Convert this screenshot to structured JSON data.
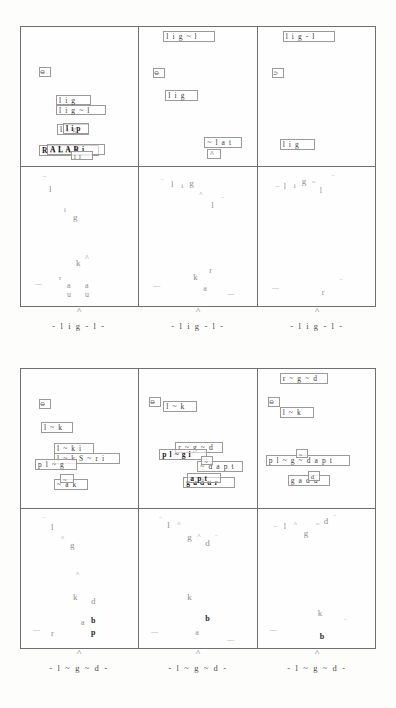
{
  "document": {
    "kind": "scanned-figure-page",
    "background_color": "#fdfdfc",
    "ink_color": "#2b2b2b",
    "box_color": "#9a9a9a",
    "frame_color": "#6f6f6f",
    "faint_color": "#8e8e8e"
  },
  "figures": [
    {
      "id": "figure-top",
      "caption_text": "- l i g - l -",
      "caption_hat": "^",
      "caption_suffix": "+2",
      "cells": [
        {
          "id": "top-cell-1",
          "tokens": [
            {
              "label": "⊖",
              "kind": "glyphbox",
              "x": 18,
              "y": 40,
              "w": 12,
              "h": 10
            },
            {
              "label": "l i g",
              "kind": "plain",
              "x": 35,
              "y": 68,
              "w": 35,
              "h": 10
            },
            {
              "label": "l i g ~ l",
              "kind": "plain",
              "x": 35,
              "y": 78,
              "w": 50,
              "h": 10
            },
            {
              "label": "l i g",
              "kind": "plain",
              "x": 36,
              "y": 97,
              "w": 32,
              "h": 11
            },
            {
              "label": "l i p",
              "kind": "dense",
              "x": 42,
              "y": 96,
              "w": 26,
              "h": 11
            },
            {
              "label": "R A L A R",
              "kind": "dense",
              "x": 18,
              "y": 118,
              "w": 60,
              "h": 11
            },
            {
              "label": "A L A R i",
              "kind": "dense",
              "x": 26,
              "y": 117,
              "w": 58,
              "h": 11
            },
            {
              "label": "l l",
              "kind": "tiny",
              "x": 50,
              "y": 124,
              "w": 22,
              "h": 9
            }
          ],
          "glyphs": []
        },
        {
          "id": "top-cell-2",
          "tokens": [
            {
              "label": "l i g ~ l",
              "kind": "plain",
              "x": 24,
              "y": 4,
              "w": 52,
              "h": 11
            },
            {
              "label": "⊖",
              "kind": "glyphbox",
              "x": 14,
              "y": 41,
              "w": 12,
              "h": 10
            },
            {
              "label": "l i g",
              "kind": "plain",
              "x": 26,
              "y": 63,
              "w": 33,
              "h": 11
            },
            {
              "label": "~ l a t",
              "kind": "plain",
              "x": 65,
              "y": 110,
              "w": 38,
              "h": 11
            },
            {
              "label": "^",
              "kind": "plain",
              "x": 68,
              "y": 122,
              "w": 14,
              "h": 10
            }
          ],
          "glyphs": []
        },
        {
          "id": "top-cell-3",
          "tokens": [
            {
              "label": "l i g - l",
              "kind": "plain",
              "x": 25,
              "y": 4,
              "w": 52,
              "h": 11
            },
            {
              "label": "⊃",
              "kind": "glyphbox",
              "x": 14,
              "y": 41,
              "w": 12,
              "h": 10
            },
            {
              "label": "l i g",
              "kind": "plain",
              "x": 22,
              "y": 112,
              "w": 35,
              "h": 11
            }
          ],
          "glyphs": []
        },
        {
          "id": "top-cell-4",
          "tokens": [],
          "glyphs": [
            {
              "ch": "‾",
              "x": 22,
              "y": 10,
              "size": "s2",
              "tone": ""
            },
            {
              "ch": "l",
              "x": 28,
              "y": 18,
              "size": "s3",
              "tone": ""
            },
            {
              "ch": "i",
              "x": 43,
              "y": 40,
              "size": "s1",
              "tone": ""
            },
            {
              "ch": "g",
              "x": 52,
              "y": 46,
              "size": "s3",
              "tone": ""
            },
            {
              "ch": "k",
              "x": 55,
              "y": 92,
              "size": "s3",
              "tone": ""
            },
            {
              "ch": "^",
              "x": 64,
              "y": 88,
              "size": "s2",
              "tone": ""
            },
            {
              "ch": "r",
              "x": 38,
              "y": 108,
              "size": "s1",
              "tone": ""
            },
            {
              "ch": "a",
              "x": 46,
              "y": 115,
              "size": "s2",
              "tone": ""
            },
            {
              "ch": "a",
              "x": 64,
              "y": 115,
              "size": "s2",
              "tone": ""
            },
            {
              "ch": "—",
              "x": 14,
              "y": 114,
              "size": "s1",
              "tone": ""
            },
            {
              "ch": "u",
              "x": 46,
              "y": 124,
              "size": "s2",
              "tone": ""
            },
            {
              "ch": "u",
              "x": 64,
              "y": 124,
              "size": "s2",
              "tone": ""
            }
          ]
        },
        {
          "id": "top-cell-5",
          "tokens": [],
          "glyphs": [
            {
              "ch": "‾",
              "x": 22,
              "y": 12,
              "size": "s1",
              "tone": ""
            },
            {
              "ch": "l",
              "x": 32,
              "y": 14,
              "size": "s2",
              "tone": ""
            },
            {
              "ch": "i",
              "x": 42,
              "y": 16,
              "size": "s1",
              "tone": ""
            },
            {
              "ch": "g",
              "x": 50,
              "y": 12,
              "size": "s3",
              "tone": ""
            },
            {
              "ch": "^",
              "x": 60,
              "y": 24,
              "size": "s1",
              "tone": ""
            },
            {
              "ch": "l",
              "x": 72,
              "y": 34,
              "size": "s3",
              "tone": ""
            },
            {
              "ch": "‾",
              "x": 82,
              "y": 30,
              "size": "s1",
              "tone": ""
            },
            {
              "ch": "k",
              "x": 54,
              "y": 106,
              "size": "s3",
              "tone": ""
            },
            {
              "ch": "r",
              "x": 70,
              "y": 100,
              "size": "s2",
              "tone": ""
            },
            {
              "ch": "—",
              "x": 14,
              "y": 116,
              "size": "s1",
              "tone": ""
            },
            {
              "ch": "a",
              "x": 64,
              "y": 118,
              "size": "s2",
              "tone": ""
            },
            {
              "ch": "—",
              "x": 88,
              "y": 124,
              "size": "s1",
              "tone": ""
            }
          ]
        },
        {
          "id": "top-cell-6",
          "tokens": [],
          "glyphs": [
            {
              "ch": "–",
              "x": 18,
              "y": 16,
              "size": "s1",
              "tone": ""
            },
            {
              "ch": "l",
              "x": 26,
              "y": 16,
              "size": "s2",
              "tone": ""
            },
            {
              "ch": "i",
              "x": 36,
              "y": 16,
              "size": "s1",
              "tone": ""
            },
            {
              "ch": "g",
              "x": 44,
              "y": 10,
              "size": "s3",
              "tone": ""
            },
            {
              "ch": "~",
              "x": 54,
              "y": 12,
              "size": "s1",
              "tone": ""
            },
            {
              "ch": "l",
              "x": 62,
              "y": 20,
              "size": "s2",
              "tone": ""
            },
            {
              "ch": "‾",
              "x": 74,
              "y": 8,
              "size": "s1",
              "tone": ""
            },
            {
              "ch": "—",
              "x": 14,
              "y": 118,
              "size": "s1",
              "tone": ""
            },
            {
              "ch": "r",
              "x": 64,
              "y": 122,
              "size": "s2",
              "tone": ""
            },
            {
              "ch": "‾",
              "x": 82,
              "y": 112,
              "size": "s1",
              "tone": ""
            }
          ]
        }
      ]
    },
    {
      "id": "figure-bottom",
      "caption_text": "- l ~ g ~ d -",
      "caption_hat": "^",
      "caption_suffix": "+2",
      "cells": [
        {
          "id": "bottom-cell-1",
          "tokens": [
            {
              "label": "⊖",
              "kind": "glyphbox",
              "x": 18,
              "y": 30,
              "w": 12,
              "h": 10
            },
            {
              "label": "l ~ k",
              "kind": "plain",
              "x": 20,
              "y": 53,
              "w": 32,
              "h": 11
            },
            {
              "label": "l ~ k i",
              "kind": "plain",
              "x": 33,
              "y": 74,
              "w": 40,
              "h": 11
            },
            {
              "label": "l ~ k S ~ r i",
              "kind": "plain",
              "x": 33,
              "y": 84,
              "w": 66,
              "h": 11
            },
            {
              "label": "p l ~ g",
              "kind": "plain",
              "x": 14,
              "y": 90,
              "w": 42,
              "h": 11
            },
            {
              "label": "~ a k",
              "kind": "plain",
              "x": 33,
              "y": 110,
              "w": 34,
              "h": 11
            },
            {
              "label": "~",
              "kind": "tiny",
              "x": 39,
              "y": 105,
              "w": 14,
              "h": 9
            }
          ],
          "glyphs": []
        },
        {
          "id": "bottom-cell-2",
          "tokens": [
            {
              "label": "⊖",
              "kind": "glyphbox",
              "x": 10,
              "y": 28,
              "w": 12,
              "h": 10
            },
            {
              "label": "l ~ k",
              "kind": "plain",
              "x": 24,
              "y": 32,
              "w": 34,
              "h": 11
            },
            {
              "label": "r ~ g ~ d",
              "kind": "plain",
              "x": 36,
              "y": 73,
              "w": 48,
              "h": 11
            },
            {
              "label": "p l ~ g i",
              "kind": "dense",
              "x": 20,
              "y": 80,
              "w": 48,
              "h": 11
            },
            {
              "label": "~ d a p t",
              "kind": "plain",
              "x": 58,
              "y": 92,
              "w": 46,
              "h": 11
            },
            {
              "label": "~",
              "kind": "tiny",
              "x": 62,
              "y": 87,
              "w": 12,
              "h": 9
            },
            {
              "label": "g a d u r",
              "kind": "dense",
              "x": 44,
              "y": 108,
              "w": 52,
              "h": 11
            },
            {
              "label": "a p t",
              "kind": "dense",
              "x": 48,
              "y": 104,
              "w": 34,
              "h": 10
            }
          ],
          "glyphs": []
        },
        {
          "id": "bottom-cell-3",
          "tokens": [
            {
              "label": "r ~ g ~ d",
              "kind": "plain",
              "x": 22,
              "y": 4,
              "w": 48,
              "h": 11
            },
            {
              "label": "⊖",
              "kind": "glyphbox",
              "x": 10,
              "y": 28,
              "w": 12,
              "h": 10
            },
            {
              "label": "l ~ k",
              "kind": "plain",
              "x": 22,
              "y": 38,
              "w": 34,
              "h": 11
            },
            {
              "label": "p l ~ g ~ d a p t",
              "kind": "plain",
              "x": 8,
              "y": 86,
              "w": 84,
              "h": 11
            },
            {
              "label": "~",
              "kind": "tiny",
              "x": 38,
              "y": 80,
              "w": 12,
              "h": 9
            },
            {
              "label": "g a d u",
              "kind": "plain",
              "x": 30,
              "y": 106,
              "w": 42,
              "h": 11
            },
            {
              "label": "d",
              "kind": "tiny",
              "x": 50,
              "y": 102,
              "w": 12,
              "h": 10
            }
          ],
          "glyphs": []
        },
        {
          "id": "bottom-cell-4",
          "tokens": [],
          "glyphs": [
            {
              "ch": "‾",
              "x": 22,
              "y": 8,
              "size": "s1",
              "tone": ""
            },
            {
              "ch": "l",
              "x": 30,
              "y": 14,
              "size": "s3",
              "tone": ""
            },
            {
              "ch": "^",
              "x": 40,
              "y": 26,
              "size": "s1",
              "tone": ""
            },
            {
              "ch": "g",
              "x": 49,
              "y": 32,
              "size": "s3",
              "tone": ""
            },
            {
              "ch": "^",
              "x": 55,
              "y": 62,
              "size": "s1",
              "tone": ""
            },
            {
              "ch": "k",
              "x": 52,
              "y": 84,
              "size": "s3",
              "tone": ""
            },
            {
              "ch": "d",
              "x": 70,
              "y": 88,
              "size": "s3",
              "tone": ""
            },
            {
              "ch": "a",
              "x": 60,
              "y": 110,
              "size": "s2",
              "tone": ""
            },
            {
              "ch": "b",
              "x": 70,
              "y": 108,
              "size": "s2",
              "tone": "bold"
            },
            {
              "ch": "—",
              "x": 12,
              "y": 118,
              "size": "s1",
              "tone": ""
            },
            {
              "ch": "r",
              "x": 30,
              "y": 120,
              "size": "s3",
              "tone": ""
            },
            {
              "ch": "p",
              "x": 70,
              "y": 120,
              "size": "s2",
              "tone": "bold"
            }
          ]
        },
        {
          "id": "bottom-cell-5",
          "tokens": [],
          "glyphs": [
            {
              "ch": "‾",
              "x": 20,
              "y": 8,
              "size": "s1",
              "tone": ""
            },
            {
              "ch": "l",
              "x": 28,
              "y": 12,
              "size": "s3",
              "tone": ""
            },
            {
              "ch": "^",
              "x": 38,
              "y": 12,
              "size": "s1",
              "tone": ""
            },
            {
              "ch": "g",
              "x": 48,
              "y": 24,
              "size": "s3",
              "tone": ""
            },
            {
              "ch": "^",
              "x": 58,
              "y": 24,
              "size": "s1",
              "tone": ""
            },
            {
              "ch": "d",
              "x": 66,
              "y": 30,
              "size": "s3",
              "tone": ""
            },
            {
              "ch": "‾",
              "x": 76,
              "y": 26,
              "size": "s1",
              "tone": ""
            },
            {
              "ch": "k",
              "x": 48,
              "y": 84,
              "size": "s3",
              "tone": ""
            },
            {
              "ch": "b",
              "x": 66,
              "y": 106,
              "size": "s2",
              "tone": "bold"
            },
            {
              "ch": "—",
              "x": 12,
              "y": 120,
              "size": "s1",
              "tone": ""
            },
            {
              "ch": "a",
              "x": 56,
              "y": 120,
              "size": "s2",
              "tone": ""
            },
            {
              "ch": "—",
              "x": 88,
              "y": 128,
              "size": "s1",
              "tone": ""
            }
          ]
        },
        {
          "id": "bottom-cell-6",
          "tokens": [],
          "glyphs": [
            {
              "ch": "–",
              "x": 16,
              "y": 14,
              "size": "s1",
              "tone": ""
            },
            {
              "ch": "l",
              "x": 26,
              "y": 14,
              "size": "s2",
              "tone": ""
            },
            {
              "ch": "^",
              "x": 36,
              "y": 12,
              "size": "s1",
              "tone": ""
            },
            {
              "ch": "g",
              "x": 46,
              "y": 20,
              "size": "s3",
              "tone": ""
            },
            {
              "ch": "~",
              "x": 58,
              "y": 12,
              "size": "s1",
              "tone": ""
            },
            {
              "ch": "d",
              "x": 66,
              "y": 8,
              "size": "s3",
              "tone": ""
            },
            {
              "ch": "‾",
              "x": 76,
              "y": 6,
              "size": "s1",
              "tone": ""
            },
            {
              "ch": "k",
              "x": 60,
              "y": 100,
              "size": "s3",
              "tone": ""
            },
            {
              "ch": "—",
              "x": 12,
              "y": 118,
              "size": "s1",
              "tone": ""
            },
            {
              "ch": "‾",
              "x": 86,
              "y": 110,
              "size": "s1",
              "tone": ""
            },
            {
              "ch": "b",
              "x": 62,
              "y": 124,
              "size": "s2",
              "tone": "bold"
            }
          ]
        }
      ]
    }
  ]
}
